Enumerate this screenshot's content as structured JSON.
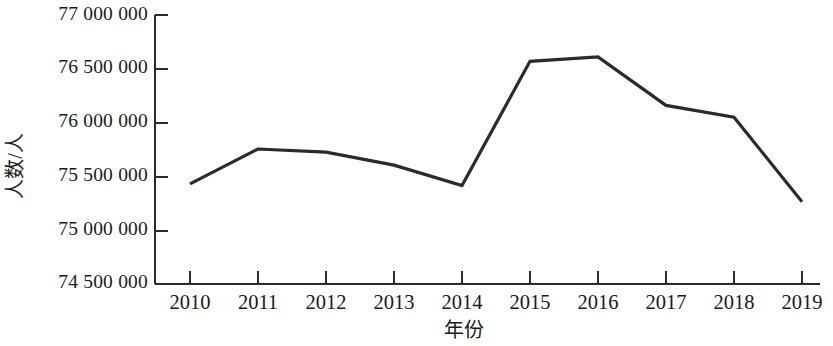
{
  "chart_data": {
    "type": "line",
    "title": "",
    "xlabel": "年份",
    "ylabel": "人数/人",
    "categories": [
      "2010",
      "2011",
      "2012",
      "2013",
      "2014",
      "2015",
      "2016",
      "2017",
      "2018",
      "2019"
    ],
    "x": [
      2010,
      2011,
      2012,
      2013,
      2014,
      2015,
      2016,
      2017,
      2018,
      2019
    ],
    "values": [
      75430000,
      75755000,
      75725000,
      75605000,
      75415000,
      76570000,
      76610000,
      76160000,
      76050000,
      75265000
    ],
    "series": [
      {
        "name": "人数",
        "values": [
          75430000,
          75755000,
          75725000,
          75605000,
          75415000,
          76570000,
          76610000,
          76160000,
          76050000,
          75265000
        ]
      }
    ],
    "ylim": [
      74500000,
      77000000
    ],
    "ytick_values": [
      74500000,
      75000000,
      75500000,
      76000000,
      76500000,
      77000000
    ],
    "ytick_labels": [
      "74 500 000",
      "75 000 000",
      "75 500 000",
      "76 000 000",
      "76 500 000",
      "77 000 000"
    ],
    "xtick_labels": [
      "2010",
      "2011",
      "2012",
      "2013",
      "2014",
      "2015",
      "2016",
      "2017",
      "2018",
      "2019"
    ],
    "grid": false,
    "legend": false,
    "legend_position": "none",
    "line_color": "#2b2b2b",
    "axis_color": "#2a2a2a",
    "background_color": "#ffffff",
    "markers": false,
    "annotations": []
  },
  "axis_titles": {
    "y": "人数/人",
    "x": "年份"
  }
}
